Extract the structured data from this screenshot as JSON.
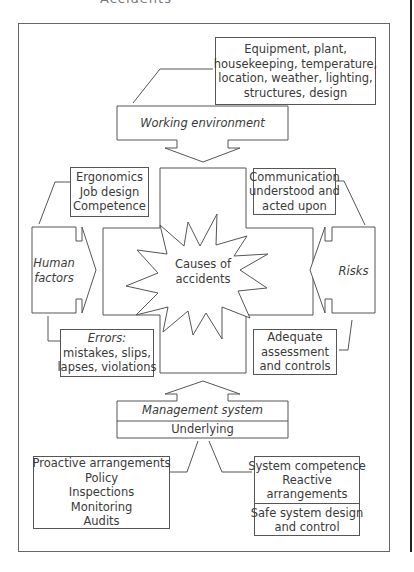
{
  "heading_fragment": "Accidents",
  "diagram": {
    "title": "Causes of accidents",
    "center": {
      "label_line1": "Causes of",
      "label_line2": "accidents"
    },
    "environment": {
      "details": [
        "Equipment, plant,",
        "housekeeping, temperature,",
        "location, weather, lighting,",
        "structures, design"
      ],
      "label": "Working environment"
    },
    "human_factors": {
      "label_line1": "Human",
      "label_line2": "factors",
      "top_box": [
        "Ergonomics",
        "Job design",
        "Competence"
      ],
      "bottom_box": {
        "heading": "Errors:",
        "lines": [
          "mistakes, slips,",
          "lapses, violations"
        ]
      }
    },
    "risks": {
      "label": "Risks",
      "top_box": [
        "Communication",
        "understood and",
        "acted upon"
      ],
      "bottom_box": [
        "Adequate",
        "assessment",
        "and controls"
      ]
    },
    "management": {
      "label": "Management system",
      "sub_label": "Underlying",
      "left_box": [
        "Proactive arrangements",
        "Policy",
        "Inspections",
        "Monitoring",
        "Audits"
      ],
      "right_box_top": [
        "System competence",
        "Reactive",
        "arrangements"
      ],
      "right_box_bottom": [
        "Safe system design",
        "and control"
      ]
    }
  },
  "colors": {
    "line": "#555555",
    "text": "#3a3a3a",
    "margin_rule": "#222222",
    "background": "#ffffff"
  }
}
